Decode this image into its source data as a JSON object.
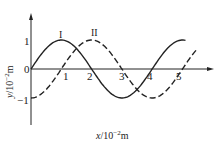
{
  "chart_data": {
    "type": "line",
    "title": "",
    "xlabel": "x/10^-2 m",
    "ylabel": "y/10^-2 m",
    "x_ticks": [
      "1",
      "2",
      "3",
      "4",
      "5"
    ],
    "y_ticks": [
      "1",
      "0",
      "-1"
    ],
    "xlim": [
      0,
      6
    ],
    "ylim": [
      -1.5,
      1.8
    ],
    "grid": false,
    "series": [
      {
        "name": "I",
        "style": "solid",
        "x": [
          0,
          1,
          2,
          3,
          4,
          5
        ],
        "values": [
          0,
          1,
          0,
          -1,
          0,
          1
        ]
      },
      {
        "name": "II",
        "style": "dashed",
        "x": [
          0,
          1,
          2,
          3,
          4,
          5
        ],
        "values": [
          -1,
          0,
          1,
          0,
          -1,
          0
        ]
      }
    ]
  },
  "labels": {
    "curve1": "I",
    "curve2": "II",
    "origin": "0",
    "y_pos1": "1",
    "y_neg1": "−1",
    "x1": "1",
    "x2": "2",
    "x3": "3",
    "x4": "4",
    "x5": "5",
    "xaxis_var": "x",
    "xaxis_unit": "/10",
    "xaxis_exp": "−2",
    "xaxis_m": "m",
    "yaxis_var": "y",
    "yaxis_unit": "/10",
    "yaxis_exp": "−2",
    "yaxis_m": "m"
  }
}
